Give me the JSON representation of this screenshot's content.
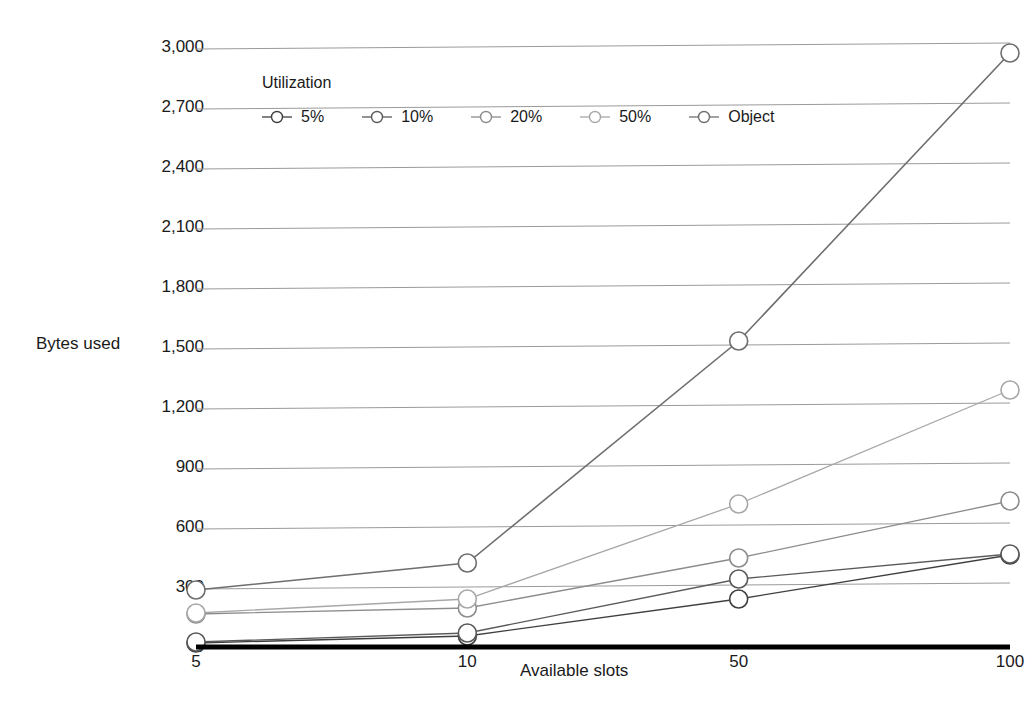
{
  "chart_data": {
    "type": "line",
    "title": "",
    "xlabel": "Available slots",
    "ylabel": "Bytes used",
    "categories": [
      "5",
      "10",
      "50",
      "100"
    ],
    "ylim": [
      0,
      3000
    ],
    "yticks": [
      0,
      300,
      600,
      900,
      1200,
      1500,
      1800,
      2100,
      2400,
      2700,
      3000
    ],
    "ytick_labels": [
      "0",
      "300",
      "600",
      "900",
      "1,200",
      "1,500",
      "1,800",
      "2,100",
      "2,400",
      "2,700",
      "3,000"
    ],
    "grid": true,
    "legend_title": "Utilization",
    "legend_position": "top-left-inside",
    "series": [
      {
        "name": "5%",
        "values": [
          20,
          55,
          240,
          460
        ],
        "color": "#3f3f3f"
      },
      {
        "name": "10%",
        "values": [
          25,
          70,
          340,
          465
        ],
        "color": "#5a5a5a"
      },
      {
        "name": "20%",
        "values": [
          165,
          195,
          445,
          730
        ],
        "color": "#8c8c8c"
      },
      {
        "name": "50%",
        "values": [
          170,
          240,
          715,
          1285
        ],
        "color": "#a8a8a8"
      },
      {
        "name": "Object",
        "values": [
          285,
          420,
          1530,
          2970
        ],
        "color": "#6e6e6e"
      }
    ]
  }
}
